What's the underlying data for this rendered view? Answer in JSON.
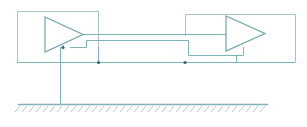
{
  "diagram": {
    "title": "",
    "type": "circuit-schematic",
    "colors": {
      "line": "#7fb3b8",
      "box": "#a9c4c7",
      "node": "#2f6b70",
      "hatch": "#9fb7ba"
    },
    "components": [
      {
        "id": "amp-left",
        "kind": "amplifier",
        "label": ""
      },
      {
        "id": "amp-right",
        "kind": "amplifier",
        "label": ""
      },
      {
        "id": "enclosure-left",
        "kind": "enclosure",
        "label": ""
      },
      {
        "id": "enclosure-right",
        "kind": "enclosure",
        "label": ""
      },
      {
        "id": "ground",
        "kind": "earth-ground",
        "label": ""
      }
    ],
    "nodes": [
      {
        "id": "node-amp-left-ref",
        "x": 63,
        "y": 47
      },
      {
        "id": "node-bus-left",
        "x": 98,
        "y": 62
      },
      {
        "id": "node-bus-right",
        "x": 184,
        "y": 62
      }
    ],
    "labels": []
  }
}
